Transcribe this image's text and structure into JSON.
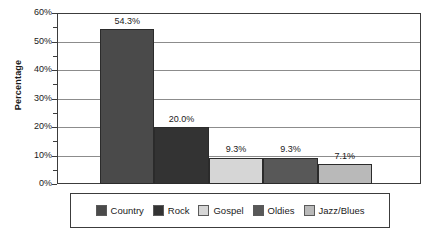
{
  "chart_data": {
    "type": "bar",
    "title": "",
    "subtitle": "",
    "xlabel": "",
    "ylabel": "Percentage",
    "categories": [
      "Country",
      "Rock",
      "Gospel",
      "Oldies",
      "Jazz/Blues"
    ],
    "values": [
      54.3,
      20.0,
      9.3,
      9.3,
      7.1
    ],
    "data_labels": [
      "54.3%",
      "20.0%",
      "9.3%",
      "9.3%",
      "7.1%"
    ],
    "ylim": [
      0,
      60
    ],
    "y_ticks": [
      0,
      10,
      20,
      30,
      40,
      50,
      60
    ],
    "y_tick_labels": [
      "0%",
      "10%",
      "20%",
      "30%",
      "40%",
      "50%",
      "60%"
    ],
    "y_minor_ticks": [
      5,
      15,
      25,
      35,
      45,
      55
    ],
    "grid": "horizontal",
    "legend_position": "bottom",
    "series_colors": [
      "#4a4a4a",
      "#333333",
      "#d6d6d6",
      "#585858",
      "#b9b9b9"
    ],
    "legend": [
      {
        "label": "Country",
        "color": "#4a4a4a"
      },
      {
        "label": "Rock",
        "color": "#333333"
      },
      {
        "label": "Gospel",
        "color": "#d6d6d6"
      },
      {
        "label": "Oldies",
        "color": "#585858"
      },
      {
        "label": "Jazz/Blues",
        "color": "#b9b9b9"
      }
    ]
  },
  "axis": {
    "y_title": "Percentage"
  }
}
